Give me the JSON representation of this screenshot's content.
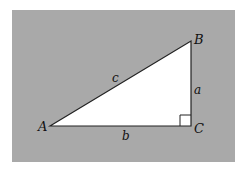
{
  "diagram": {
    "type": "right-triangle",
    "background_color": "#a9a9a9",
    "triangle_fill": "#ffffff",
    "stroke_color": "#222222",
    "vertices": {
      "A": {
        "label": "A"
      },
      "B": {
        "label": "B"
      },
      "C": {
        "label": "C"
      }
    },
    "sides": {
      "a": {
        "label": "a"
      },
      "b": {
        "label": "b"
      },
      "c": {
        "label": "c"
      }
    },
    "right_angle_at": "C"
  }
}
